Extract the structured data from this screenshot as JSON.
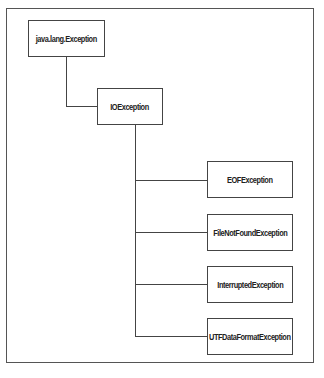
{
  "diagram": {
    "type": "class-hierarchy",
    "root": {
      "label": "java.lang.Exception"
    },
    "parent": {
      "label": "IOException"
    },
    "children": [
      {
        "label": "EOFException"
      },
      {
        "label": "FileNotFoundException"
      },
      {
        "label": "InterruptedException"
      },
      {
        "label": "UTFDataFormatException"
      }
    ]
  }
}
